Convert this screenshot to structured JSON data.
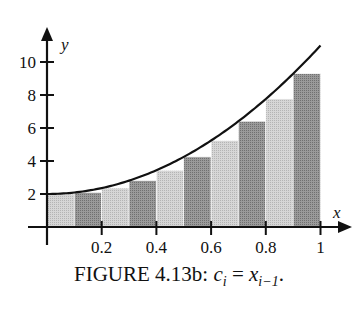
{
  "chart_data": {
    "type": "bar",
    "title": "",
    "caption_label": "FIGURE 4.13b:",
    "caption_math": "c_i = x_{i-1}.",
    "xlabel": "x",
    "ylabel": "y",
    "xlim": [
      0,
      1
    ],
    "ylim": [
      0,
      11
    ],
    "x_ticks": [
      0.2,
      0.4,
      0.6,
      0.8,
      1
    ],
    "x_tick_labels": [
      "0.2",
      "0.4",
      "0.6",
      "0.8",
      "1"
    ],
    "y_ticks": [
      2,
      4,
      6,
      8,
      10
    ],
    "y_tick_labels": [
      "2",
      "4",
      "6",
      "8",
      "10"
    ],
    "bar_left_edges": [
      0,
      0.1,
      0.2,
      0.3,
      0.4,
      0.5,
      0.6,
      0.7,
      0.8,
      0.9
    ],
    "bar_width": 0.1,
    "values": [
      2.0,
      2.09,
      2.36,
      2.81,
      3.44,
      4.25,
      5.24,
      6.41,
      7.76,
      9.29
    ],
    "curve": "y = 2 + 9x^2",
    "bar_colors": [
      "#c8c8c8",
      "#8e8e8e"
    ],
    "grid": false,
    "legend": null
  }
}
